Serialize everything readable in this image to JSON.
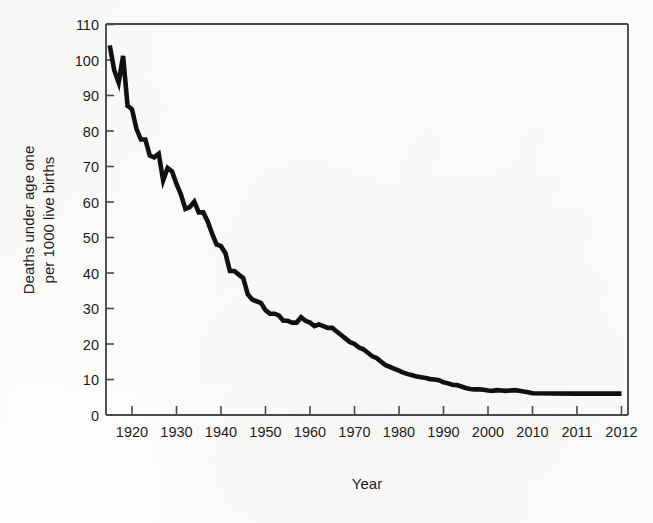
{
  "chart_data": {
    "type": "line",
    "title": "",
    "xlabel": "Year",
    "ylabel": "Deaths under age one per 1000 live births",
    "ylabel_line1": "Deaths under age one",
    "ylabel_line2": "per 1000 live births",
    "ylim": [
      0,
      110
    ],
    "ytick_labels": [
      "0",
      "10",
      "20",
      "30",
      "40",
      "50",
      "60",
      "70",
      "80",
      "90",
      "100",
      "110"
    ],
    "ytick_values": [
      0,
      10,
      20,
      30,
      40,
      50,
      60,
      70,
      80,
      90,
      100,
      110
    ],
    "xtick_labels": [
      "1920",
      "1930",
      "1940",
      "1950",
      "1960",
      "1970",
      "1980",
      "1990",
      "2000",
      "2010",
      "2011",
      "2012"
    ],
    "xtick_values": [
      1920,
      1930,
      1940,
      1950,
      1960,
      1970,
      1980,
      1990,
      2000,
      2010,
      2011,
      2012
    ],
    "x_axis_note": "Axis is non-uniform: decade spacing through 2010, then single-year spacing for 2011 and 2012",
    "grid": false,
    "legend": false,
    "line_color": "#101010",
    "background_color": "#fdfdfb",
    "axis_color": "#4a4a4a",
    "series": [
      {
        "name": "Infant mortality rate",
        "x": [
          1915,
          1916,
          1917,
          1918,
          1919,
          1920,
          1921,
          1922,
          1923,
          1924,
          1925,
          1926,
          1927,
          1928,
          1929,
          1930,
          1931,
          1932,
          1933,
          1934,
          1935,
          1936,
          1937,
          1938,
          1939,
          1940,
          1941,
          1942,
          1943,
          1944,
          1945,
          1946,
          1947,
          1948,
          1949,
          1950,
          1951,
          1952,
          1953,
          1954,
          1955,
          1956,
          1957,
          1958,
          1959,
          1960,
          1961,
          1962,
          1963,
          1964,
          1965,
          1966,
          1967,
          1968,
          1969,
          1970,
          1971,
          1972,
          1973,
          1974,
          1975,
          1976,
          1977,
          1978,
          1979,
          1980,
          1981,
          1982,
          1983,
          1984,
          1985,
          1986,
          1987,
          1988,
          1989,
          1990,
          1991,
          1992,
          1993,
          1994,
          1995,
          1996,
          1997,
          1998,
          1999,
          2000,
          2001,
          2002,
          2003,
          2004,
          2005,
          2006,
          2007,
          2008,
          2009,
          2010,
          2011,
          2012
        ],
        "values": [
          104,
          97,
          93.5,
          101,
          87,
          86,
          80.5,
          77.5,
          77.5,
          73,
          72.5,
          73.5,
          66,
          69.5,
          68.5,
          65,
          62,
          58,
          58.5,
          60,
          57,
          57,
          54.5,
          51,
          48,
          47.5,
          45.5,
          40.5,
          40.5,
          39.5,
          38.5,
          34,
          32.5,
          32,
          31.5,
          29.5,
          28.5,
          28.5,
          28,
          26.5,
          26.5,
          26,
          26,
          27.5,
          26.5,
          26,
          25,
          25.5,
          25,
          24.5,
          24.5,
          23.5,
          22.5,
          21.5,
          20.5,
          20,
          19,
          18.5,
          17.5,
          16.5,
          16,
          15,
          14,
          13.5,
          13,
          12.5,
          11.9,
          11.5,
          11.2,
          10.8,
          10.6,
          10.4,
          10.1,
          10,
          9.8,
          9.2,
          8.9,
          8.5,
          8.4,
          8,
          7.6,
          7.3,
          7.2,
          7.2,
          7.1,
          6.9,
          6.8,
          7,
          6.9,
          6.8,
          6.9,
          7,
          6.8,
          6.6,
          6.4,
          6.1,
          6.0,
          6.0
        ]
      }
    ]
  },
  "figure": {
    "x_axis_title": "Year",
    "y_axis_title_line1": "Deaths under age one",
    "y_axis_title_line2": "per 1000 live births"
  }
}
